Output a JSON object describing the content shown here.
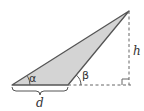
{
  "diagram": {
    "type": "geometry-triangle",
    "labels": {
      "alpha": "α",
      "beta": "β",
      "height": "h",
      "base": "d"
    },
    "colors": {
      "fill": "#d4d4d4",
      "stroke": "#555555",
      "dashed": "#666666",
      "text": "#333333"
    },
    "vertices": {
      "left": [
        12,
        85
      ],
      "middle": [
        68,
        85
      ],
      "top": [
        129,
        11
      ]
    }
  }
}
